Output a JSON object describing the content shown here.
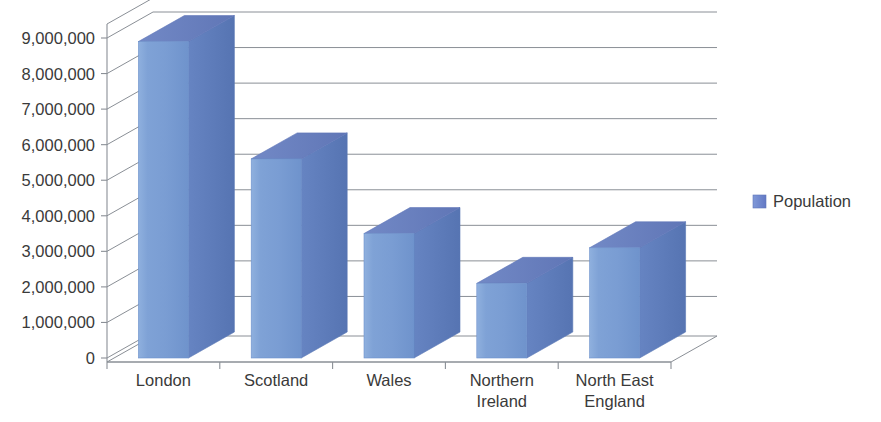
{
  "chart_data": {
    "type": "bar",
    "title": "",
    "subtitle": "",
    "xlabel": "",
    "ylabel": "",
    "categories": [
      "London",
      "Scotland",
      "Wales",
      "Northern Ireland",
      "North East England"
    ],
    "category_lines": [
      [
        "London"
      ],
      [
        "Scotland"
      ],
      [
        "Wales"
      ],
      [
        "Northern",
        "Ireland"
      ],
      [
        "North East",
        "England"
      ]
    ],
    "series": [
      {
        "name": "Population",
        "values": [
          8900000,
          5600000,
          3500000,
          2100000,
          3100000
        ],
        "color": "#7b9fd4"
      }
    ],
    "ylim": [
      0,
      9000000
    ],
    "ytick_values": [
      0,
      1000000,
      2000000,
      3000000,
      4000000,
      5000000,
      6000000,
      7000000,
      8000000,
      9000000
    ],
    "ytick_labels": [
      "0",
      "1,000,000",
      "2,000,000",
      "3,000,000",
      "4,000,000",
      "5,000,000",
      "6,000,000",
      "7,000,000",
      "8,000,000",
      "9,000,000"
    ],
    "grid": true,
    "grid_axis": "y",
    "legend": {
      "position": "right",
      "entries": [
        {
          "label": "Population",
          "color": "#6f8fd0"
        }
      ]
    },
    "style": {
      "three_d": true,
      "bar_front_color": "#7b9fd4",
      "bar_front_color_light": "#9ab6e0",
      "bar_side_color": "#5d7ebb",
      "bar_top_color": "#6b7fc0",
      "gridline_color": "#8a8f96",
      "axis_color": "#8a8f96",
      "text_color": "#3a3a3a",
      "background": "#ffffff"
    }
  },
  "legend": {
    "population_label": "Population"
  }
}
